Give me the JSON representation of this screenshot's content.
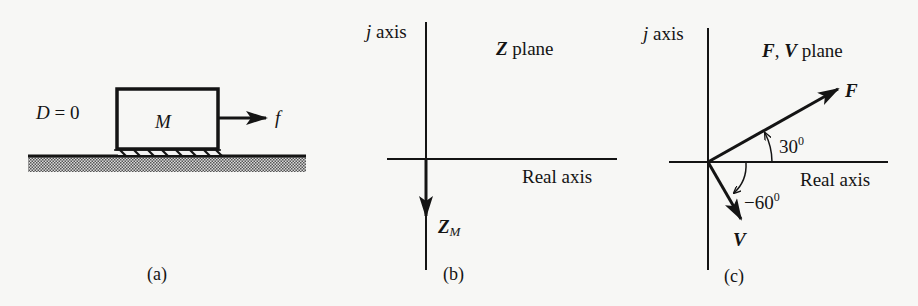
{
  "figure": {
    "panels": [
      {
        "id": "a",
        "caption": "(a)",
        "damping_label": "D = 0",
        "mass_label": "M",
        "force_label": "f"
      },
      {
        "id": "b",
        "caption": "(b)",
        "imag_axis_label_j": "j",
        "imag_axis_label": "axis",
        "real_axis_label": "Real axis",
        "plane_symbol": "Z",
        "plane_word": "plane",
        "vector_symbol": "Z",
        "vector_subscript": "M"
      },
      {
        "id": "c",
        "caption": "(c)",
        "imag_axis_label_j": "j",
        "imag_axis_label": "axis",
        "real_axis_label": "Real axis",
        "plane_symbol_1": "F",
        "plane_sep": ",",
        "plane_symbol_2": "V",
        "plane_word": "plane",
        "vector_f_label": "F",
        "vector_v_label": "V",
        "angle_f": "30",
        "angle_v": "−60",
        "degree": "0"
      }
    ]
  },
  "colors": {
    "ink": "#141414",
    "paper": "#f7f7f5",
    "ground_hatch": "#555555"
  }
}
